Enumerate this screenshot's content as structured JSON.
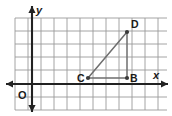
{
  "figure": {
    "name": "coordinate-grid-triangle",
    "width": 172,
    "height": 116,
    "background": "#ffffff"
  },
  "axes": {
    "x_label": "x",
    "y_label": "y",
    "origin_label": "O",
    "axis_color": "#222222",
    "x_axis_y": 84,
    "y_axis_x": 32,
    "x_axis_start": 6,
    "x_axis_end": 168,
    "y_axis_start": 6,
    "y_axis_end": 112
  },
  "grid": {
    "color": "#9a9a9a",
    "spacing": 13,
    "x_start": 15,
    "x_end": 167,
    "y_start": 18,
    "y_end": 110,
    "vertical_x": [
      15,
      28,
      41,
      54,
      67,
      80,
      93,
      106,
      119,
      132,
      145,
      158
    ],
    "horizontal_y": [
      18,
      31,
      44,
      57,
      70,
      84,
      97,
      110
    ]
  },
  "points": [
    {
      "label": "C",
      "x": 88,
      "y": 78,
      "label_x": 77,
      "label_y": 82
    },
    {
      "label": "B",
      "x": 127,
      "y": 78,
      "label_x": 130,
      "label_y": 82
    },
    {
      "label": "D",
      "x": 127,
      "y": 32,
      "label_x": 131,
      "label_y": 28
    }
  ],
  "segments": [
    {
      "name": "segment-c-d",
      "from": "C",
      "to": "D",
      "x1": 88,
      "y1": 78,
      "x2": 127,
      "y2": 32
    },
    {
      "name": "segment-c-b",
      "from": "C",
      "to": "B",
      "x1": 88,
      "y1": 78,
      "x2": 127,
      "y2": 78
    },
    {
      "name": "segment-b-d",
      "from": "B",
      "to": "D",
      "x1": 127,
      "y1": 78,
      "x2": 127,
      "y2": 32
    }
  ],
  "colors": {
    "grid": "#9a9a9a",
    "axis": "#222222",
    "segment": "#6e6e6e",
    "point": "#3a3a3a",
    "label": "#1a1a1a"
  },
  "chart_data": {
    "type": "scatter",
    "title": "",
    "xlabel": "x",
    "ylabel": "y",
    "grid": true,
    "legend": "none",
    "grid_units": {
      "origin_grid_x": 32,
      "origin_grid_y": 84,
      "unit_px": 13
    },
    "points": [
      {
        "label": "C",
        "x": 4.3,
        "y": 0.5
      },
      {
        "label": "B",
        "x": 7.3,
        "y": 0.5
      },
      {
        "label": "D",
        "x": 7.3,
        "y": 4.0
      }
    ],
    "segments": [
      {
        "from": "C",
        "to": "D"
      },
      {
        "from": "C",
        "to": "B"
      },
      {
        "from": "B",
        "to": "D"
      }
    ],
    "xlim": [
      -1.3,
      10.4
    ],
    "ylim": [
      -2.0,
      5.1
    ]
  }
}
